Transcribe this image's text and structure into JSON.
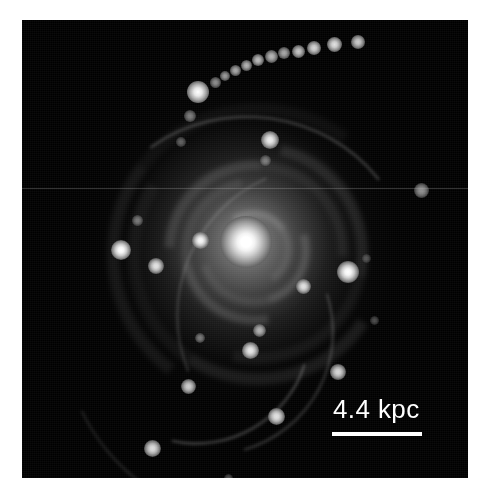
{
  "figure": {
    "domain": "astronomical-image",
    "canvas": {
      "width": 491,
      "height": 502,
      "background": "#ffffff"
    },
    "image_frame": {
      "x": 22,
      "y": 20,
      "width": 446,
      "height": 458,
      "background": "#000000"
    },
    "colors": {
      "background": "#ffffff",
      "sky": "#000000",
      "annotation": "#ffffff",
      "nucleus": "#ffffff",
      "scanline": "#bebebe"
    }
  },
  "scalebar": {
    "label": "4.4 kpc",
    "value": 4.4,
    "unit": "kpc",
    "label_x": 311,
    "label_y": 376,
    "line_x": 310,
    "line_y": 412,
    "line_width": 90,
    "line_height": 4,
    "color": "#ffffff"
  },
  "galaxy": {
    "name": "galaxy-nucleus",
    "center_x_pct": 50.2,
    "center_y_pct": 48.5,
    "nucleus_size": 52,
    "halo_rx": 190,
    "halo_ry": 200
  },
  "artifacts": {
    "scanline": {
      "name": "horizontal-scanline",
      "y": 168,
      "opacity": 0.52
    }
  },
  "spiral_arms": [
    {
      "size": 64,
      "rotate": 12,
      "border": 7,
      "opacity": 0.2
    },
    {
      "size": 96,
      "rotate": 118,
      "border": 8,
      "opacity": 0.17
    },
    {
      "size": 130,
      "rotate": 214,
      "border": 9,
      "opacity": 0.15
    },
    {
      "size": 164,
      "rotate": 318,
      "border": 10,
      "opacity": 0.13
    },
    {
      "size": 200,
      "rotate": 58,
      "border": 11,
      "opacity": 0.11
    },
    {
      "size": 238,
      "rotate": 168,
      "border": 12,
      "opacity": 0.09
    },
    {
      "size": 278,
      "rotate": 262,
      "border": 12,
      "opacity": 0.07
    }
  ],
  "shells": [
    {
      "name": "shell-upper-arc",
      "x": 66,
      "y": 96,
      "w": 320,
      "h": 300,
      "rotate": 8,
      "border": 2,
      "opacity": 0.3
    },
    {
      "name": "shell-left-arc",
      "x": 54,
      "y": 176,
      "w": 250,
      "h": 260,
      "rotate": 118,
      "border": 2,
      "opacity": 0.26
    },
    {
      "name": "shell-lower-left-arc",
      "x": 76,
      "y": 228,
      "w": 210,
      "h": 190,
      "rotate": 150,
      "border": 2,
      "opacity": 0.34
    },
    {
      "name": "shell-right-arc",
      "x": 150,
      "y": 150,
      "w": 290,
      "h": 280,
      "rotate": 292,
      "border": 2,
      "opacity": 0.22
    },
    {
      "name": "shell-outer-sweep",
      "x": 40,
      "y": 126,
      "w": 382,
      "h": 372,
      "rotate": 200,
      "border": 2,
      "opacity": 0.16
    }
  ],
  "stream": {
    "name": "tidal-stream",
    "description": "curved chain of star-forming knots in the upper field",
    "knots": [
      {
        "x": 176,
        "y": 72,
        "size": 22,
        "brightness": 1.0
      },
      {
        "x": 193,
        "y": 62,
        "size": 11,
        "brightness": 0.55
      },
      {
        "x": 203,
        "y": 56,
        "size": 10,
        "brightness": 0.6
      },
      {
        "x": 213,
        "y": 50,
        "size": 11,
        "brightness": 0.66
      },
      {
        "x": 224,
        "y": 45,
        "size": 11,
        "brightness": 0.7
      },
      {
        "x": 236,
        "y": 40,
        "size": 12,
        "brightness": 0.74
      },
      {
        "x": 249,
        "y": 36,
        "size": 13,
        "brightness": 0.72
      },
      {
        "x": 262,
        "y": 33,
        "size": 12,
        "brightness": 0.66
      },
      {
        "x": 276,
        "y": 31,
        "size": 13,
        "brightness": 0.78
      },
      {
        "x": 292,
        "y": 28,
        "size": 14,
        "brightness": 0.84
      },
      {
        "x": 312,
        "y": 24,
        "size": 15,
        "brightness": 0.88
      },
      {
        "x": 336,
        "y": 22,
        "size": 14,
        "brightness": 0.8
      },
      {
        "x": 168,
        "y": 96,
        "size": 12,
        "brightness": 0.48
      },
      {
        "x": 159,
        "y": 122,
        "size": 10,
        "brightness": 0.36
      }
    ]
  },
  "point_sources": [
    {
      "name": "source-inner-left",
      "x": 178,
      "y": 220,
      "size": 17,
      "brightness": 0.96
    },
    {
      "name": "source-west-bright",
      "x": 99,
      "y": 230,
      "size": 20,
      "brightness": 1.0
    },
    {
      "name": "source-west-lower",
      "x": 134,
      "y": 246,
      "size": 16,
      "brightness": 0.88
    },
    {
      "name": "source-east-bright",
      "x": 326,
      "y": 252,
      "size": 22,
      "brightness": 1.0
    },
    {
      "name": "source-inner-right",
      "x": 281,
      "y": 266,
      "size": 15,
      "brightness": 0.86
    },
    {
      "name": "source-north-companion",
      "x": 248,
      "y": 120,
      "size": 18,
      "brightness": 0.92
    },
    {
      "name": "source-north-faint",
      "x": 243,
      "y": 140,
      "size": 11,
      "brightness": 0.4
    },
    {
      "name": "source-halo-far-east",
      "x": 399,
      "y": 170,
      "size": 15,
      "brightness": 0.56
    },
    {
      "name": "source-upper-left-halo",
      "x": 115,
      "y": 200,
      "size": 11,
      "brightness": 0.42
    },
    {
      "name": "source-south-center",
      "x": 237,
      "y": 310,
      "size": 13,
      "brightness": 0.66
    },
    {
      "name": "source-south-lower",
      "x": 228,
      "y": 330,
      "size": 17,
      "brightness": 0.9
    },
    {
      "name": "source-south-east",
      "x": 316,
      "y": 352,
      "size": 16,
      "brightness": 0.84
    },
    {
      "name": "source-south-west",
      "x": 166,
      "y": 366,
      "size": 15,
      "brightness": 0.8
    },
    {
      "name": "source-far-south",
      "x": 254,
      "y": 396,
      "size": 17,
      "brightness": 0.88
    },
    {
      "name": "source-bottom-left",
      "x": 130,
      "y": 428,
      "size": 17,
      "brightness": 0.86
    },
    {
      "name": "source-arc-knot",
      "x": 178,
      "y": 318,
      "size": 10,
      "brightness": 0.44
    },
    {
      "name": "source-faint-bottom",
      "x": 206,
      "y": 458,
      "size": 9,
      "brightness": 0.3
    },
    {
      "name": "source-faint-ne",
      "x": 352,
      "y": 300,
      "size": 9,
      "brightness": 0.28
    },
    {
      "name": "source-faint-se",
      "x": 344,
      "y": 238,
      "size": 9,
      "brightness": 0.26
    }
  ]
}
